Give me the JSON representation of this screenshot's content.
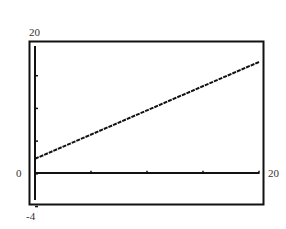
{
  "chart_data": {
    "type": "line",
    "title": "",
    "xlabel": "",
    "ylabel": "",
    "xlim": [
      0,
      20
    ],
    "ylim": [
      -4,
      20
    ],
    "x_tick_step": 5,
    "y_tick_step": 5,
    "series": [
      {
        "name": "line",
        "x": [
          0,
          20
        ],
        "y": [
          2.3,
          17.1
        ],
        "style": "stepped-pixel"
      }
    ]
  },
  "labels": {
    "ymax": "20",
    "ymin": "-4",
    "xmin": "0",
    "xmax": "20"
  }
}
